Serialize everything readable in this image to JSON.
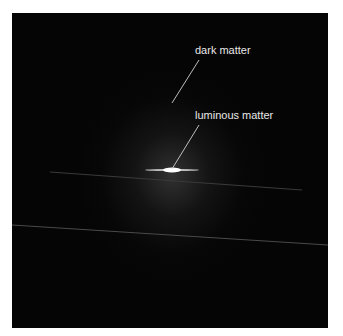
{
  "figure": {
    "labels": {
      "dark_matter": "dark matter",
      "luminous_matter": "luminous matter"
    },
    "colors": {
      "background": "#050505",
      "halo": "#6e6e6e",
      "text": "#e8e8e8",
      "core": "#ffffff"
    }
  }
}
